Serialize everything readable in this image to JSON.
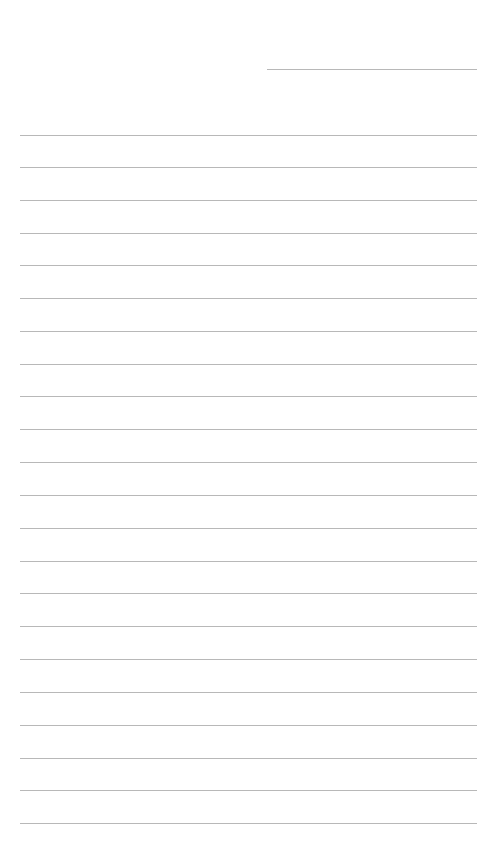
{
  "page": {
    "type": "lined-paper-template",
    "background_color": "#ffffff",
    "line_color": "#b8b8b8"
  },
  "header_line": {
    "x1": 267,
    "x2": 477,
    "y": 69
  },
  "body_lines": {
    "x1": 20,
    "x2": 477,
    "y_positions": [
      135,
      167,
      200,
      233,
      265,
      298,
      331,
      364,
      396,
      429,
      462,
      495,
      528,
      561,
      593,
      626,
      659,
      692,
      725,
      758,
      790,
      823
    ]
  },
  "footer": {
    "text": ""
  }
}
